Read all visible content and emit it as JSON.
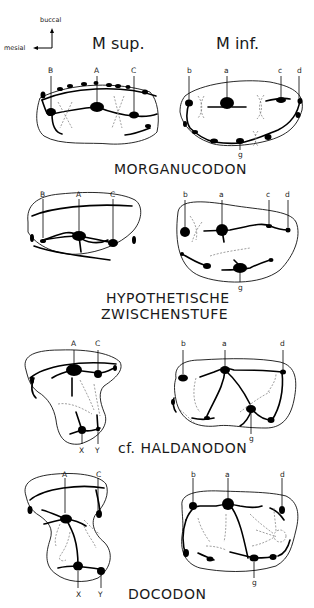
{
  "orientation": {
    "buccal_label": "buccal",
    "mesial_label": "mesial"
  },
  "column_headers": {
    "upper": "M sup.",
    "lower": "M inf."
  },
  "rows": [
    {
      "taxon": "MORGANUCODON",
      "upper_cusps": [
        "B",
        "A",
        "C"
      ],
      "lower_cusps": [
        "b",
        "a",
        "c",
        "d",
        "g"
      ]
    },
    {
      "taxon_line1": "HYPOTHETISCHE",
      "taxon_line2": "ZWISCHENSTUFE",
      "upper_cusps": [
        "B",
        "A",
        "C"
      ],
      "lower_cusps": [
        "b",
        "a",
        "c",
        "d",
        "g"
      ]
    },
    {
      "taxon": "cf. HALDANODON",
      "upper_cusps": [
        "A",
        "C",
        "X",
        "Y"
      ],
      "lower_cusps": [
        "b",
        "a",
        "d",
        "g"
      ]
    },
    {
      "taxon": "DOCODON",
      "upper_cusps": [
        "A",
        "C",
        "X",
        "Y"
      ],
      "lower_cusps": [
        "b",
        "a",
        "d",
        "g"
      ]
    }
  ]
}
